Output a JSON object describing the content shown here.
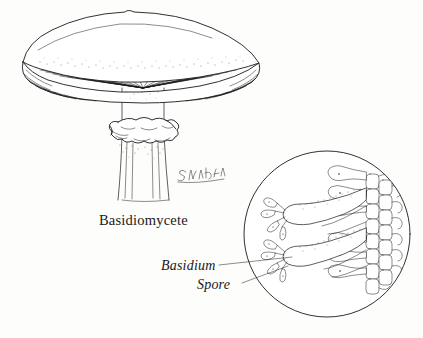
{
  "figure": {
    "title": "Basidiomycete",
    "kind": "pen-and-ink biological illustration",
    "background_color": "#fdfdfc",
    "ink_color": "#1a1a1a"
  },
  "specimen": {
    "name": "Basidiomycete",
    "parts": {
      "cap": "mushroom-cap",
      "gills": "radiating-gills",
      "stipe": "stem",
      "annulus": "ring"
    }
  },
  "signature": {
    "text": "Susan Nili",
    "style": "handwritten"
  },
  "inset": {
    "shape": "circle",
    "subject": "hymenium-detail",
    "labels": [
      {
        "text": "Basidium",
        "target": "basidium-cell"
      },
      {
        "text": "Spore",
        "target": "spore"
      }
    ],
    "structures": {
      "basidia_count": 2,
      "spores_per_basidium": 4,
      "hyphal_cell_column": "packed-rectangular-cells"
    }
  },
  "labels": {
    "basidiomycete": "Basidiomycete",
    "basidium": "Basidium",
    "spore": "Spore"
  }
}
